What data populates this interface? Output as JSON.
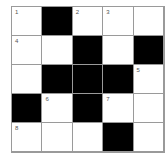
{
  "puzzle": {
    "rows": 5,
    "cols": 5,
    "cells": [
      [
        {
          "black": false,
          "num": "1"
        },
        {
          "black": true,
          "num": ""
        },
        {
          "black": false,
          "num": "2"
        },
        {
          "black": false,
          "num": "3"
        },
        {
          "black": false,
          "num": ""
        }
      ],
      [
        {
          "black": false,
          "num": "4"
        },
        {
          "black": false,
          "num": ""
        },
        {
          "black": true,
          "num": ""
        },
        {
          "black": false,
          "num": ""
        },
        {
          "black": true,
          "num": ""
        }
      ],
      [
        {
          "black": false,
          "num": ""
        },
        {
          "black": true,
          "num": ""
        },
        {
          "black": true,
          "num": ""
        },
        {
          "black": true,
          "num": ""
        },
        {
          "black": false,
          "num": "5"
        }
      ],
      [
        {
          "black": true,
          "num": ""
        },
        {
          "black": false,
          "num": "6"
        },
        {
          "black": true,
          "num": ""
        },
        {
          "black": false,
          "num": "7"
        },
        {
          "black": false,
          "num": ""
        }
      ],
      [
        {
          "black": false,
          "num": "8"
        },
        {
          "black": false,
          "num": ""
        },
        {
          "black": false,
          "num": ""
        },
        {
          "black": true,
          "num": ""
        },
        {
          "black": false,
          "num": ""
        }
      ]
    ]
  },
  "colors": {
    "block": "#000000",
    "cell": "#ffffff",
    "gridline": "#9a9a9a"
  }
}
